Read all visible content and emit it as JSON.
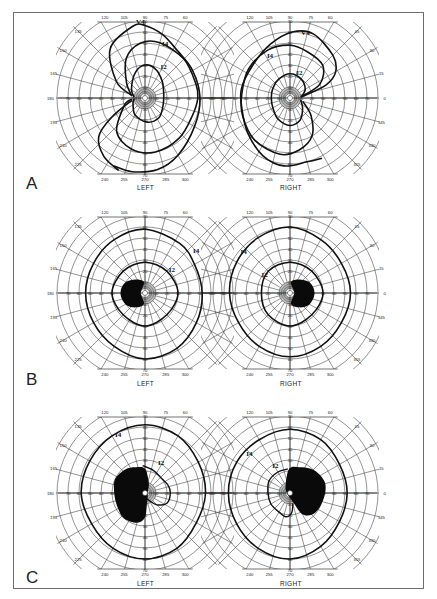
{
  "figure": {
    "type": "Goldmann kinetic perimetry visual fields",
    "grid": {
      "max_eccentricity_deg": 70,
      "ring_step_deg": 10,
      "meridian_step_deg": 15,
      "inner_fine_rings_deg": [
        2,
        4,
        6,
        8
      ],
      "line_color": "#3a3a3a",
      "isopter_color": "#111111",
      "scotoma_color": "#0a0a0a"
    },
    "meridian_labels_left": [
      "120",
      "105",
      "90",
      "75",
      "60",
      "135",
      "150",
      "165",
      "180",
      "195",
      "210",
      "225",
      "240",
      "255",
      "270",
      "285",
      "300"
    ],
    "meridian_labels_right": [
      "120",
      "105",
      "90",
      "75",
      "60",
      "45",
      "30",
      "15",
      "0",
      "345",
      "330",
      "315",
      "240",
      "255",
      "270",
      "285",
      "300"
    ],
    "ring_labels": [
      "10",
      "20",
      "30",
      "40",
      "50",
      "60",
      "70",
      "80"
    ],
    "panels": [
      {
        "letter": "A",
        "left": {
          "eye_label": "LEFT",
          "isopters": [
            {
              "label": "V4",
              "type": "outer-bow"
            },
            {
              "label": "I4",
              "type": "mid-bow"
            },
            {
              "label": "I2",
              "type": "inner-bow"
            }
          ]
        },
        "right": {
          "eye_label": "RIGHT",
          "isopters": [
            {
              "label": "V4",
              "type": "outer-bow"
            },
            {
              "label": "I4",
              "type": "mid-bow"
            },
            {
              "label": "I2",
              "type": "inner-bow"
            }
          ]
        }
      },
      {
        "letter": "B",
        "left": {
          "eye_label": "LEFT",
          "isopters": [
            {
              "label": "I4",
              "type": "ring"
            },
            {
              "label": "I2",
              "type": "ring"
            }
          ],
          "scotoma": "central-paracentral (temporal side)"
        },
        "right": {
          "eye_label": "RIGHT",
          "isopters": [
            {
              "label": "I4",
              "type": "ring"
            },
            {
              "label": "I2",
              "type": "ring"
            }
          ],
          "scotoma": "central-paracentral (temporal side)"
        }
      },
      {
        "letter": "C",
        "left": {
          "eye_label": "LEFT",
          "isopters": [
            {
              "label": "I4",
              "type": "ring"
            },
            {
              "label": "I2",
              "type": "partial-ring"
            }
          ],
          "scotoma": "large centrocecal"
        },
        "right": {
          "eye_label": "RIGHT",
          "isopters": [
            {
              "label": "I4",
              "type": "ring"
            },
            {
              "label": "I2",
              "type": "partial-ring"
            }
          ],
          "scotoma": "large centrocecal"
        }
      }
    ]
  }
}
